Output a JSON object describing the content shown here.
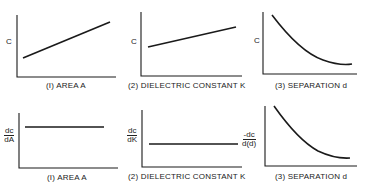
{
  "figure": {
    "top_row": [
      {
        "ylabel": "C",
        "xlabel": "(I) AREA  A",
        "trend": "linear increasing"
      },
      {
        "ylabel": "C",
        "xlabel": "(2) DIELECTRIC  CONSTANT  K",
        "trend": "linear increasing (smaller slope)"
      },
      {
        "ylabel": "C",
        "xlabel": "(3) SEPARATION  d",
        "trend": "decreasing, inverse curve"
      }
    ],
    "bottom_row": [
      {
        "ylabel_num": "dc",
        "ylabel_den": "dA",
        "xlabel": "(I) AREA  A",
        "trend": "constant (high)"
      },
      {
        "ylabel_num": "dc",
        "ylabel_den": "dK",
        "xlabel": "(2) DIELECTRIC  CONSTANT  K",
        "trend": "constant (low)"
      },
      {
        "ylabel_num": "-dc",
        "ylabel_den": "d(d)",
        "xlabel": "(3) SEPARATION  d",
        "trend": "decreasing curve"
      }
    ],
    "line_color": "#1a1a1a"
  }
}
